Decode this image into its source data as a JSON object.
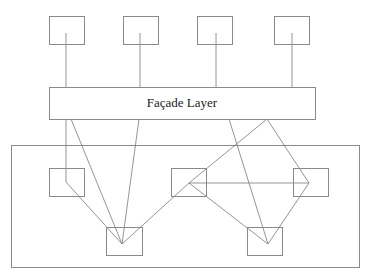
{
  "diagram": {
    "facade": {
      "label": "Façade Layer",
      "x": 49,
      "y": 87,
      "w": 266,
      "h": 32
    },
    "subsystem_container": {
      "x": 11,
      "y": 145,
      "w": 348,
      "h": 122
    },
    "client_boxes": [
      {
        "id": "client-1",
        "x": 49,
        "y": 16,
        "w": 35,
        "h": 28
      },
      {
        "id": "client-2",
        "x": 123,
        "y": 16,
        "w": 35,
        "h": 28
      },
      {
        "id": "client-3",
        "x": 197,
        "y": 16,
        "w": 35,
        "h": 28
      },
      {
        "id": "client-4",
        "x": 274,
        "y": 16,
        "w": 35,
        "h": 28
      }
    ],
    "subsystem_boxes": [
      {
        "id": "subsystem-left",
        "x": 49,
        "y": 168,
        "w": 35,
        "h": 28
      },
      {
        "id": "subsystem-center",
        "x": 171,
        "y": 168,
        "w": 35,
        "h": 28
      },
      {
        "id": "subsystem-right",
        "x": 293,
        "y": 168,
        "w": 35,
        "h": 28
      },
      {
        "id": "subsystem-bottom-left",
        "x": 106,
        "y": 227,
        "w": 36,
        "h": 28
      },
      {
        "id": "subsystem-bottom-right",
        "x": 247,
        "y": 227,
        "w": 35,
        "h": 28
      }
    ],
    "edges": [
      {
        "id": "client-1-to-facade",
        "points": "66,33 66,87"
      },
      {
        "id": "client-2-to-facade",
        "points": "140,33 140,87"
      },
      {
        "id": "client-3-to-facade",
        "points": "216,33 216,87"
      },
      {
        "id": "client-4-to-facade",
        "points": "292,33 292,87"
      },
      {
        "id": "facade-to-left-to-bottom-left",
        "points": "66,119 66,182 122,244"
      },
      {
        "id": "facade-to-bottom-left-a",
        "points": "71,119 122,244"
      },
      {
        "id": "facade-to-bottom-left-b",
        "points": "139,119 122,244"
      },
      {
        "id": "bottom-left-to-center-to-facade",
        "points": "122,244 189,183 267,119"
      },
      {
        "id": "facade-to-right-to-bottom-right",
        "points": "267,119 309,183 268,244"
      },
      {
        "id": "center-to-right",
        "points": "189,183 309,183"
      },
      {
        "id": "center-to-bottom-right",
        "points": "189,183 268,244"
      },
      {
        "id": "facade-to-bottom-right",
        "points": "229,119 268,244"
      }
    ],
    "colors": {
      "stroke": "#8a8a8a",
      "edge": "#7a7a7a",
      "text": "#222222",
      "background": "#ffffff"
    }
  }
}
